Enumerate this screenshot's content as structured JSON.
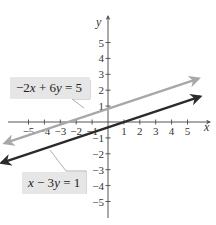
{
  "chart_data": {
    "type": "line",
    "title": "",
    "xlabel": "x",
    "ylabel": "y",
    "xlim": [
      -6,
      6
    ],
    "ylim": [
      -6,
      6
    ],
    "x_ticks": [
      -5,
      -4,
      -3,
      -2,
      -1,
      1,
      2,
      3,
      4,
      5
    ],
    "y_ticks": [
      -5,
      -4,
      -3,
      -2,
      -1,
      1,
      2,
      3,
      4,
      5
    ],
    "x_tick_labels": [
      "−5",
      "−4",
      "−3",
      "−2",
      "−1",
      "1",
      "2",
      "3",
      "4",
      "5"
    ],
    "y_tick_labels": [
      "−5",
      "−4",
      "−3",
      "−2",
      "−1",
      "1",
      "2",
      "3",
      "4",
      "5"
    ],
    "grid": false,
    "series": [
      {
        "name": "−2x + 6y = 5",
        "equation": "-2x + 6y = 5",
        "slope": 0.3333,
        "intercept": 0.8333,
        "x": [
          -6.5,
          5.7
        ],
        "y": [
          -1.33,
          2.73
        ],
        "color": "#a8a8a8"
      },
      {
        "name": "x − 3y = 1",
        "equation": "x - 3y = 1",
        "slope": 0.3333,
        "intercept": -0.3333,
        "x": [
          -6.7,
          5.8
        ],
        "y": [
          -2.57,
          1.6
        ],
        "color": "#2b2b2b"
      }
    ],
    "annotations": [
      {
        "text": "−2x + 6y = 5",
        "points_to": "gray line"
      },
      {
        "text": "x − 3y = 1",
        "points_to": "dark line"
      }
    ]
  },
  "labels": {
    "x_axis": "x",
    "y_axis": "y",
    "eq1": {
      "a": "−2",
      "v1": "x",
      "op": " + 6",
      "v2": "y",
      "rhs": " = 5"
    },
    "eq2": {
      "v1": "x",
      "op": " − 3",
      "v2": "y",
      "rhs": " = 1"
    }
  },
  "colors": {
    "axis": "#555555",
    "line_light": "#a8a8a8",
    "line_dark": "#2b2b2b",
    "label_bg": "#e6e6e6"
  }
}
